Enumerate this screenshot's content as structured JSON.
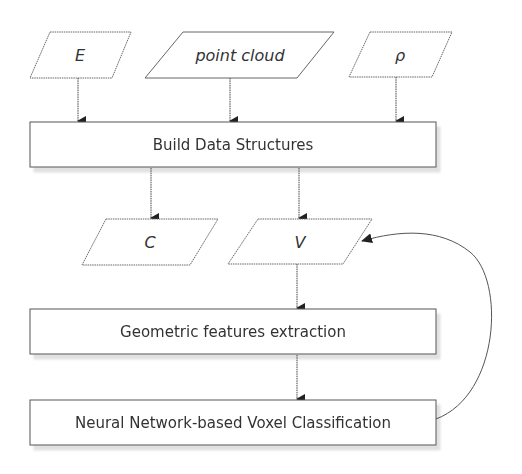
{
  "diagram": {
    "type": "flowchart",
    "inputs": [
      {
        "id": "E",
        "label": "E",
        "shape": "parallelogram"
      },
      {
        "id": "point_cloud",
        "label": "point cloud",
        "shape": "parallelogram"
      },
      {
        "id": "rho",
        "label": "ρ",
        "shape": "parallelogram"
      }
    ],
    "processes": {
      "build": {
        "label": "Build Data Structures",
        "shape": "rectangle"
      },
      "geometric": {
        "label": "Geometric features extraction",
        "shape": "rectangle"
      },
      "neural": {
        "label": "Neural Network-based Voxel Classification",
        "shape": "rectangle"
      }
    },
    "outputs": [
      {
        "id": "C",
        "label": "C",
        "shape": "parallelogram"
      },
      {
        "id": "V",
        "label": "V",
        "shape": "parallelogram"
      }
    ],
    "edges": [
      {
        "from": "E",
        "to": "build"
      },
      {
        "from": "point_cloud",
        "to": "build"
      },
      {
        "from": "rho",
        "to": "build"
      },
      {
        "from": "build",
        "to": "C"
      },
      {
        "from": "build",
        "to": "V"
      },
      {
        "from": "V",
        "to": "geometric"
      },
      {
        "from": "geometric",
        "to": "neural"
      },
      {
        "from": "neural",
        "to": "V",
        "style": "curved-feedback"
      }
    ],
    "colors": {
      "stroke": "#555555",
      "arrow": "#222222",
      "text": "#333333",
      "background": "#ffffff"
    }
  }
}
